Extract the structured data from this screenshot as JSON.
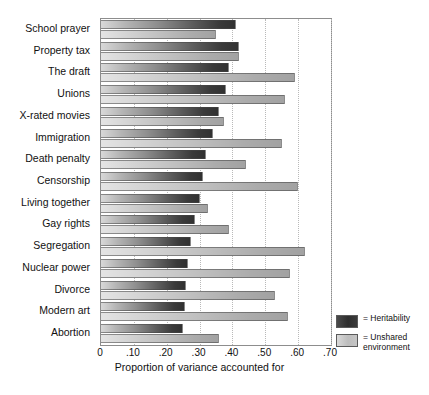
{
  "chart_data": {
    "type": "bar",
    "orientation": "horizontal",
    "title": "",
    "xlabel": "Proportion of variance accounted for",
    "ylabel": "",
    "xlim": [
      0,
      0.7
    ],
    "xticks": [
      "0",
      ".10",
      ".20",
      ".30",
      ".40",
      ".50",
      ".60",
      ".70"
    ],
    "xtickvalues": [
      0,
      0.1,
      0.2,
      0.3,
      0.4,
      0.5,
      0.6,
      0.7
    ],
    "grid": "vertical-dotted",
    "legend_position": "bottom-right",
    "categories": [
      "School prayer",
      "Property tax",
      "The draft",
      "Unions",
      "X-rated movies",
      "Immigration",
      "Death penalty",
      "Censorship",
      "Living together",
      "Gay rights",
      "Segregation",
      "Nuclear power",
      "Divorce",
      "Modern art",
      "Abortion"
    ],
    "series": [
      {
        "name": "Heritability",
        "color": "#323232",
        "values": [
          0.41,
          0.42,
          0.39,
          0.38,
          0.36,
          0.34,
          0.32,
          0.31,
          0.3,
          0.285,
          0.275,
          0.265,
          0.26,
          0.255,
          0.25
        ]
      },
      {
        "name": "Unshared environment",
        "color": "#b8b8b8",
        "values": [
          0.35,
          0.42,
          0.59,
          0.56,
          0.375,
          0.55,
          0.44,
          0.6,
          0.325,
          0.39,
          0.62,
          0.575,
          0.53,
          0.57,
          0.36
        ]
      }
    ]
  },
  "legend": {
    "items": [
      {
        "marker": "=",
        "label": "Heritability"
      },
      {
        "marker": "=",
        "label": "Unshared environment"
      }
    ]
  }
}
